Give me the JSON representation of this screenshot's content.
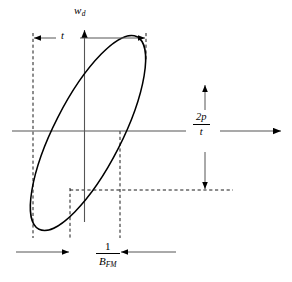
{
  "figure": {
    "type": "phase-space-diagram",
    "background_color": "#ffffff",
    "stroke_color": "#000000",
    "axes": {
      "vertical": {
        "name": "vertical-axis",
        "label": "w",
        "label_subscript": "d",
        "arrow": "up"
      },
      "horizontal": {
        "name": "horizontal-axis",
        "label": "",
        "arrow": "right"
      }
    },
    "ellipse": {
      "name": "tilted-ellipse",
      "center_x": 88,
      "center_y": 133,
      "semi_major": 108,
      "semi_minor": 34,
      "rotation_deg": -63
    },
    "annotations": {
      "top_dimension": {
        "name": "tau-dimension",
        "label": "t",
        "italic": true,
        "arrow_style": "outward-double"
      },
      "right_dimension": {
        "name": "two-pi-over-tau-dimension",
        "numerator": "2p",
        "denominator": "t",
        "arrow_style": "outward-vertical-double"
      },
      "bottom_dimension": {
        "name": "inverse-bandwidth-dimension",
        "numerator": "1",
        "denominator": "B",
        "denominator_subscript": "FM",
        "arrow_style": "inward-horizontal-double"
      }
    },
    "guide_lines": {
      "dashed_verticals_x": [
        33,
        70,
        120,
        146
      ],
      "dashed_horizontal_y": 190
    }
  }
}
